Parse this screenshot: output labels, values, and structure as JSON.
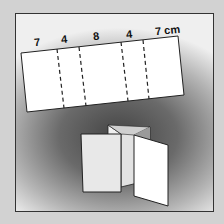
{
  "diagram": {
    "strip": {
      "labels": [
        "7",
        "4",
        "8",
        "4",
        "7 cm"
      ],
      "panel_widths_cm": [
        7,
        4,
        8,
        4,
        7
      ],
      "fold_lines": 4,
      "fold_line_style": "dashed"
    },
    "folded_model": {
      "description": "Panels stood upright in zig-zag (accordion) fold"
    },
    "colors": {
      "paper": "#ffffff",
      "outline": "#222222",
      "background_dark": "#444444",
      "background_light": "#efefef",
      "page": "#d2d2d2"
    }
  }
}
